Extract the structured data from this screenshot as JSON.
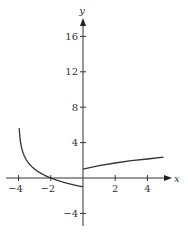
{
  "chart_data": {
    "type": "line",
    "title": "",
    "xlabel": "x",
    "ylabel": "y",
    "xlim": [
      -4.5,
      5.5
    ],
    "ylim": [
      -5,
      18
    ],
    "x_ticks": [
      -4,
      -2,
      2,
      4
    ],
    "y_ticks": [
      16,
      12,
      8,
      4,
      -4
    ],
    "x_tick_labels": [
      "−4",
      "−2",
      "2",
      "4"
    ],
    "y_tick_labels": [
      "16",
      "12",
      "8",
      "4",
      "−4"
    ],
    "grid": false,
    "legend": null,
    "series": [
      {
        "name": "left branch (x < 0)",
        "description": "Decreasing curve with vertical asymptote at x = -4, crossing x-axis at x = -2, ending at (0, -1)",
        "x": [
          -3.96,
          -3.9,
          -3.8,
          -3.6,
          -3.3,
          -3,
          -2.5,
          -2,
          -1.5,
          -1,
          -0.5,
          0
        ],
        "y": [
          16,
          6.3,
          3.3,
          2.3,
          1.5,
          1.0,
          0.4,
          0,
          -0.3,
          -0.6,
          -0.8,
          -1.0
        ]
      },
      {
        "name": "right branch (x ≥ 0)",
        "description": "Slowly increasing curve starting at (0, 1)",
        "x": [
          0,
          1,
          2,
          3,
          4,
          5
        ],
        "y": [
          1.0,
          1.4,
          1.7,
          1.95,
          2.15,
          2.35
        ]
      }
    ]
  },
  "axes": {
    "x_label": "x",
    "y_label": "y"
  }
}
